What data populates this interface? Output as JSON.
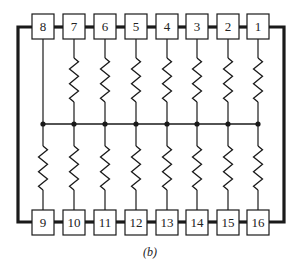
{
  "figure": {
    "caption": "(b)",
    "type": "resistor network package (16-pin) schematic",
    "colors": {
      "line": "#1a1a1a",
      "box_fill": "#ffffff",
      "background": "#ffffff"
    }
  },
  "top_row": {
    "pins": [
      {
        "label": "8",
        "x": 43,
        "has_resistor": false
      },
      {
        "label": "7",
        "x": 74,
        "has_resistor": true
      },
      {
        "label": "6",
        "x": 105,
        "has_resistor": true
      },
      {
        "label": "5",
        "x": 136,
        "has_resistor": true
      },
      {
        "label": "4",
        "x": 167,
        "has_resistor": true
      },
      {
        "label": "3",
        "x": 197,
        "has_resistor": true
      },
      {
        "label": "2",
        "x": 228,
        "has_resistor": true
      },
      {
        "label": "1",
        "x": 258,
        "has_resistor": true
      }
    ]
  },
  "bottom_row": {
    "pins": [
      {
        "label": "9",
        "x": 43,
        "has_resistor": true
      },
      {
        "label": "10",
        "x": 74,
        "has_resistor": true
      },
      {
        "label": "11",
        "x": 105,
        "has_resistor": true
      },
      {
        "label": "12",
        "x": 136,
        "has_resistor": true
      },
      {
        "label": "13",
        "x": 167,
        "has_resistor": true
      },
      {
        "label": "14",
        "x": 197,
        "has_resistor": true
      },
      {
        "label": "15",
        "x": 228,
        "has_resistor": true
      },
      {
        "label": "16",
        "x": 258,
        "has_resistor": true
      }
    ]
  },
  "common_bus": {
    "y": 124,
    "description": "common node connecting all resistors"
  },
  "package_outline": {
    "left_x": 18,
    "right_x": 284,
    "top_y": 27,
    "bottom_y": 222
  }
}
